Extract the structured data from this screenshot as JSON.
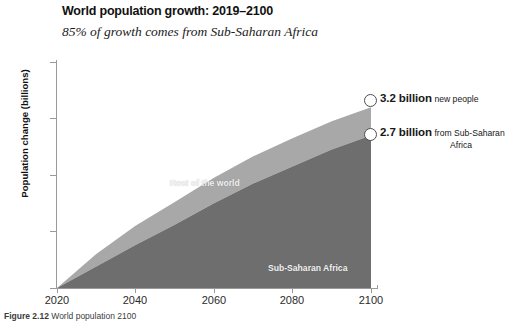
{
  "chart_data": {
    "type": "area",
    "title": "World population growth: 2019–2100",
    "subtitle": "85% of growth comes from Sub-Saharan Africa",
    "xlabel": "",
    "ylabel": "Population change (billions)",
    "stacked": true,
    "grid": false,
    "legend_position": "inline-labels",
    "xlim": [
      2020,
      2100
    ],
    "ylim": [
      0,
      4
    ],
    "xticks": [
      "2020",
      "2040",
      "2060",
      "2080",
      "2100"
    ],
    "yticks": [
      "0",
      "1",
      "2",
      "3",
      "4"
    ],
    "x": [
      2020,
      2030,
      2040,
      2050,
      2060,
      2070,
      2080,
      2090,
      2100
    ],
    "series": [
      {
        "name": "Sub-Saharan Africa",
        "color": "#6e6e6e",
        "values": [
          0.0,
          0.38,
          0.76,
          1.12,
          1.5,
          1.85,
          2.15,
          2.45,
          2.7
        ]
      },
      {
        "name": "Rest of the world",
        "color": "#a8a8a8",
        "values": [
          0.0,
          0.22,
          0.34,
          0.4,
          0.45,
          0.48,
          0.5,
          0.5,
          0.5
        ]
      }
    ],
    "totals": [
      0.0,
      0.6,
      1.1,
      1.52,
      1.95,
      2.33,
      2.65,
      2.95,
      3.2
    ],
    "annotations": [
      {
        "name": "total-growth",
        "value": "3.2 billion",
        "description": "new people",
        "at_x": 2100,
        "at_y": 3.2
      },
      {
        "name": "sub-saharan-growth",
        "value": "2.7 billion",
        "description_line1": "from Sub-Saharan",
        "description_line2": "Africa",
        "at_x": 2100,
        "at_y": 2.7
      }
    ]
  },
  "caption": {
    "figure_number": "Figure 2.12",
    "text": "World population 2100"
  }
}
